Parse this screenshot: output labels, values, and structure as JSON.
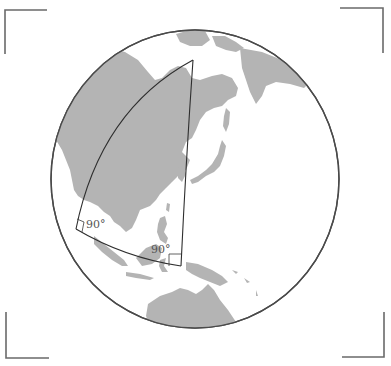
{
  "figure": {
    "colors": {
      "background": "#ffffff",
      "land": "#b4b4b4",
      "ocean": "#ffffff",
      "globe_outline": "#4a4a4a",
      "triangle_stroke": "#2e2e2e",
      "frame_brackets": "#6a6a6a"
    },
    "globe": {
      "cx": 195,
      "cy": 179,
      "rx": 144,
      "ry": 149
    },
    "triangle": {
      "vertices": [
        {
          "name": "north-vertex",
          "x": 193,
          "y": 60
        },
        {
          "name": "west-vertex",
          "x": 76,
          "y": 229
        },
        {
          "name": "southeast-vertex",
          "x": 181,
          "y": 266
        }
      ]
    },
    "angle_labels": [
      {
        "text": "90°",
        "x": 86,
        "y": 227
      },
      {
        "text": "90°",
        "x": 151,
        "y": 252
      }
    ],
    "frame": {
      "corners": [
        "top-left",
        "top-right",
        "bottom-left",
        "bottom-right"
      ]
    }
  }
}
